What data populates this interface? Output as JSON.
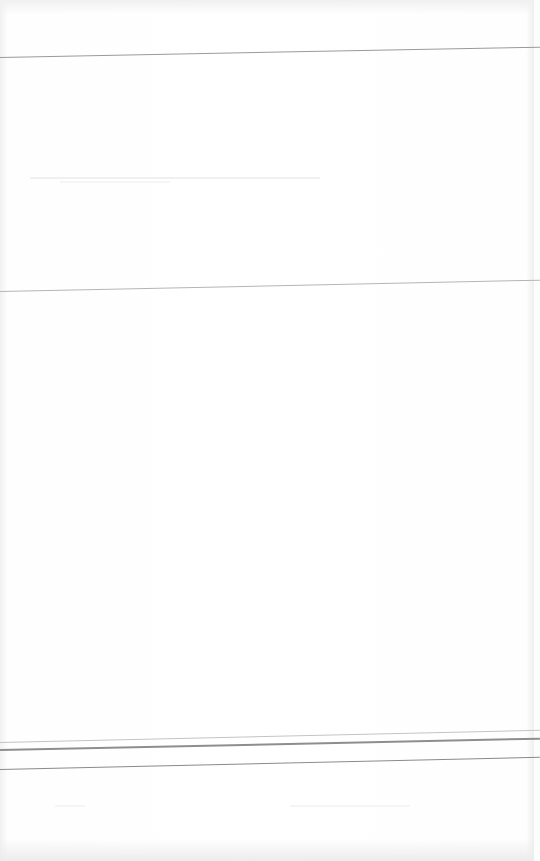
{
  "document": {
    "type": "blank scanned page",
    "text": "",
    "rules": [
      {
        "id": "rule-top",
        "y_left": 57,
        "angle_deg": -1.1,
        "color": "#9a9a9a",
        "thickness": 1
      },
      {
        "id": "rule-middle",
        "y_left": 291,
        "angle_deg": -1.2,
        "color": "#b5b5b5",
        "thickness": 1
      },
      {
        "id": "rule-bottom-1",
        "y_left": 742,
        "angle_deg": -1.3,
        "color": "#c4c4c4",
        "thickness": 1
      },
      {
        "id": "rule-bottom-2",
        "y_left": 749,
        "angle_deg": -1.2,
        "color": "#8e8e8e",
        "thickness": 2
      },
      {
        "id": "rule-bottom-3",
        "y_left": 769,
        "angle_deg": -1.3,
        "color": "#8a8a8a",
        "thickness": 1
      }
    ]
  }
}
